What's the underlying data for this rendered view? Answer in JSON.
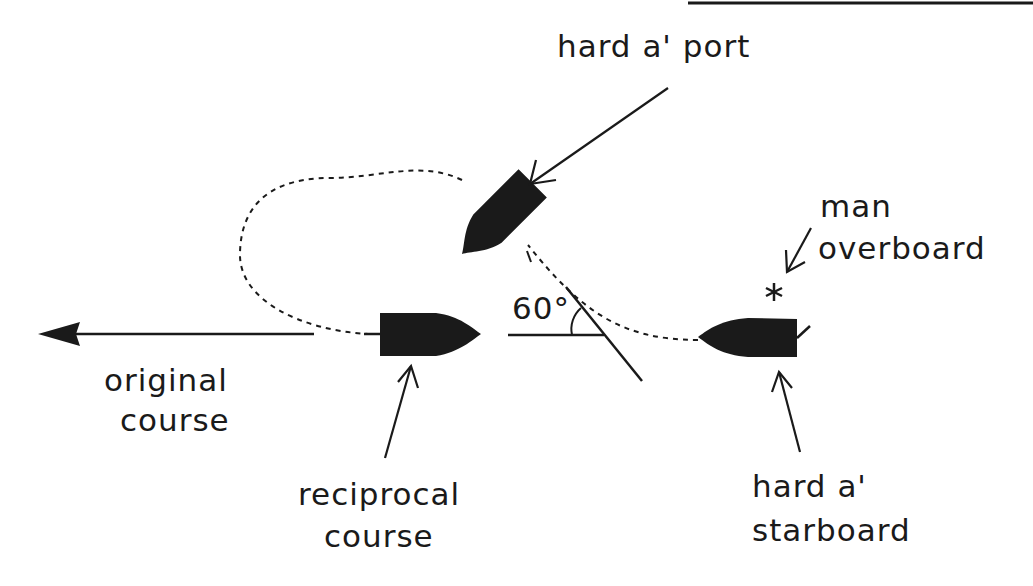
{
  "diagram": {
    "colors": {
      "ink": "#1a1a1a",
      "background": "#ffffff"
    },
    "labels": {
      "hard_port": "hard a' port",
      "man": "man",
      "overboard": "overboard",
      "angle": "60°",
      "original_1": "original",
      "original_2": "course",
      "reciprocal_1": "reciprocal",
      "reciprocal_2": "course",
      "hard_starboard_1": "hard a'",
      "hard_starboard_2": "starboard"
    },
    "angle_degrees": 60,
    "nodes": [
      {
        "id": "start",
        "label": "hard a' starboard",
        "shape": "boat"
      },
      {
        "id": "turn",
        "label": "hard a' port",
        "shape": "boat"
      },
      {
        "id": "end",
        "label": "reciprocal course",
        "shape": "boat"
      },
      {
        "id": "mob",
        "label": "man overboard",
        "shape": "asterisk"
      }
    ]
  }
}
